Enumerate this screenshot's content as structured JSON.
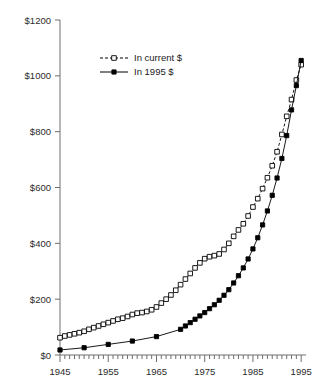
{
  "chart_data": {
    "type": "line",
    "title": "",
    "subtitle": "",
    "xlabel": "",
    "ylabel": "",
    "xlim": [
      1945,
      1996
    ],
    "ylim": [
      0,
      1200
    ],
    "grid": false,
    "legend_position": "top-left-inside",
    "y_ticks": [
      0,
      200,
      400,
      600,
      800,
      1000,
      1200
    ],
    "y_tick_labels": [
      "$0",
      "$200",
      "$400",
      "$600",
      "$800",
      "$1000",
      "$1200"
    ],
    "x_ticks": [
      1945,
      1955,
      1965,
      1975,
      1985,
      1995
    ],
    "x_tick_labels": [
      "1945",
      "1955",
      "1965",
      "1975",
      "1985",
      "1995"
    ],
    "x_minor_tick_interval": 1,
    "series": [
      {
        "name": "In current $",
        "marker": "open-square",
        "line_style": "dashed",
        "color": "#000000",
        "x": [
          1945,
          1946,
          1947,
          1948,
          1949,
          1950,
          1951,
          1952,
          1953,
          1954,
          1955,
          1956,
          1957,
          1958,
          1959,
          1960,
          1961,
          1962,
          1963,
          1964,
          1965,
          1966,
          1967,
          1968,
          1969,
          1970,
          1971,
          1972,
          1973,
          1974,
          1975,
          1976,
          1977,
          1978,
          1979,
          1980,
          1981,
          1982,
          1983,
          1984,
          1985,
          1986,
          1987,
          1988,
          1989,
          1990,
          1991,
          1992,
          1993,
          1994,
          1995
        ],
        "values": [
          62,
          68,
          72,
          76,
          80,
          85,
          92,
          98,
          104,
          110,
          116,
          122,
          128,
          132,
          138,
          145,
          150,
          152,
          156,
          162,
          172,
          186,
          200,
          215,
          232,
          252,
          272,
          292,
          312,
          330,
          345,
          352,
          356,
          362,
          378,
          400,
          425,
          448,
          470,
          498,
          530,
          560,
          596,
          635,
          678,
          728,
          790,
          855,
          915,
          985,
          1040
        ]
      },
      {
        "name": "In 1995 $",
        "marker": "filled-square",
        "line_style": "solid",
        "color": "#000000",
        "x": [
          1945,
          1950,
          1955,
          1960,
          1965,
          1970,
          1971,
          1972,
          1973,
          1974,
          1975,
          1976,
          1977,
          1978,
          1979,
          1980,
          1981,
          1982,
          1983,
          1984,
          1985,
          1986,
          1987,
          1988,
          1989,
          1990,
          1991,
          1992,
          1993,
          1994,
          1995
        ],
        "values": [
          18,
          26,
          38,
          50,
          66,
          92,
          104,
          116,
          128,
          140,
          152,
          166,
          180,
          196,
          214,
          234,
          258,
          284,
          312,
          344,
          380,
          420,
          466,
          516,
          572,
          634,
          704,
          786,
          878,
          965,
          1055
        ]
      }
    ]
  },
  "legend": {
    "items": [
      {
        "label": "In current $"
      },
      {
        "label": "In 1995 $"
      }
    ]
  }
}
